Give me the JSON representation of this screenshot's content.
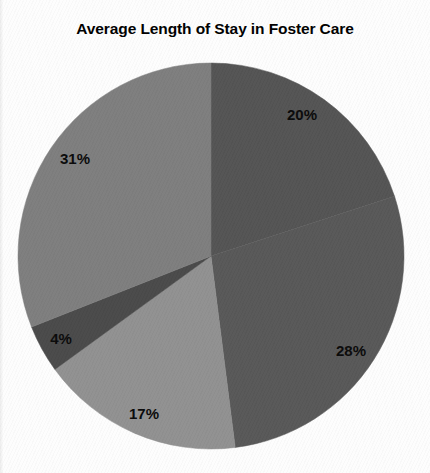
{
  "chart_data": {
    "type": "pie",
    "title": "Average Length of Stay in Foster Care",
    "xlabel": "",
    "ylabel": "",
    "legend": "none",
    "grid": false,
    "start_angle_deg": 0,
    "direction": "clockwise",
    "categories": [
      "20%",
      "28%",
      "17%",
      "4%",
      "31%"
    ],
    "values": [
      20,
      28,
      17,
      4,
      31
    ],
    "labels": [
      "20%",
      "28%",
      "17%",
      "4%",
      "31%"
    ],
    "colors": [
      "#545454",
      "#585858",
      "#919191",
      "#4a4a4a",
      "#7e7e7e"
    ],
    "slices": [
      {
        "label": "20%",
        "value": 20,
        "color": "#545454",
        "start_deg": 0,
        "end_deg": 72,
        "label_x": 302,
        "label_y": 114
      },
      {
        "label": "28%",
        "value": 28,
        "color": "#585858",
        "start_deg": 72,
        "end_deg": 172.8,
        "label_x": 351,
        "label_y": 350
      },
      {
        "label": "17%",
        "value": 17,
        "color": "#919191",
        "start_deg": 172.8,
        "end_deg": 234,
        "label_x": 144,
        "label_y": 413
      },
      {
        "label": "4%",
        "value": 4,
        "color": "#4a4a4a",
        "start_deg": 234,
        "end_deg": 248.4,
        "label_x": 61,
        "label_y": 338
      },
      {
        "label": "31%",
        "value": 31,
        "color": "#7e7e7e",
        "start_deg": 248.4,
        "end_deg": 360,
        "label_x": 75,
        "label_y": 158
      }
    ],
    "geometry": {
      "center_x": 211,
      "center_y": 256,
      "radius": 193
    },
    "background_color": "#fdfdfd",
    "label_color": "#0a0a0a",
    "title_color": "#000000"
  }
}
